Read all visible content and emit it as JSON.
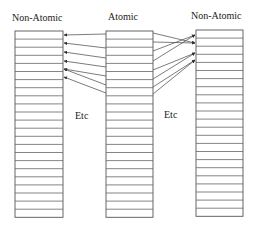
{
  "labels": {
    "left_title": "Non-Atomic",
    "middle_title": "Atomic",
    "right_title": "Non-Atomic",
    "left_etc": "Etc",
    "right_etc": "Etc"
  },
  "columns": [
    {
      "id": "left",
      "x": 15,
      "y": 31,
      "w": 48,
      "rows": 23,
      "row_h": 8.1
    },
    {
      "id": "middle",
      "x": 106,
      "y": 31,
      "w": 47,
      "rows": 23,
      "row_h": 8.1
    },
    {
      "id": "right",
      "x": 196,
      "y": 30,
      "w": 47,
      "rows": 23,
      "row_h": 8.1
    }
  ],
  "arrows_left": [
    [
      106,
      34,
      64,
      35
    ],
    [
      106,
      48,
      64,
      43
    ],
    [
      106,
      58,
      64,
      52
    ],
    [
      106,
      67,
      64,
      61
    ],
    [
      106,
      76,
      64,
      69
    ],
    [
      106,
      85,
      64,
      69
    ],
    [
      106,
      93,
      64,
      77
    ]
  ],
  "arrows_right": [
    [
      153,
      33,
      195,
      43
    ],
    [
      153,
      42,
      195,
      43
    ],
    [
      153,
      51,
      195,
      35
    ],
    [
      153,
      61,
      195,
      35
    ],
    [
      153,
      70,
      195,
      53
    ],
    [
      153,
      79,
      195,
      53
    ],
    [
      153,
      87,
      195,
      60
    ],
    [
      153,
      94,
      195,
      60
    ]
  ],
  "colors": {
    "stroke": "#555555",
    "text": "#222222",
    "background": "#ffffff"
  }
}
